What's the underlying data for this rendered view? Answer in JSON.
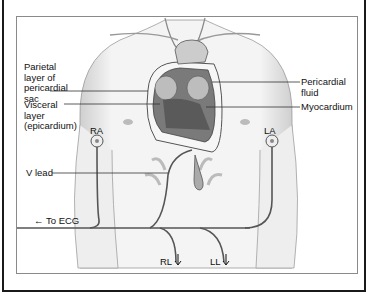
{
  "figure": {
    "labels": {
      "parietal": [
        "Parietal",
        "layer of",
        "pericardial",
        "sac"
      ],
      "visceral": [
        "Visceral",
        "layer",
        "(epicardium)"
      ],
      "pericardial_fluid": [
        "Pericardial",
        "fluid"
      ],
      "myocardium": "Myocardium",
      "ra": "RA",
      "la": "LA",
      "v_lead": "V lead",
      "to_ecg": "To ECG",
      "to_ecg_arrow": "←",
      "rl": "RL",
      "ll": "LL"
    },
    "colors": {
      "line": "#333333",
      "heart_dark": "#6a6a6a",
      "skin_shade": "#d8d8d8",
      "frame": "#1a1a1a"
    }
  }
}
